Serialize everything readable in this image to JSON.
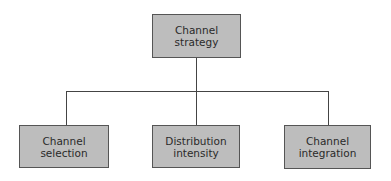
{
  "diagram": {
    "type": "hierarchy",
    "root": {
      "label": "Channel\nstrategy"
    },
    "children": [
      {
        "label": "Channel\nselection"
      },
      {
        "label": "Distribution\nintensity"
      },
      {
        "label": "Channel\nintegration"
      }
    ],
    "colors": {
      "box_fill": "#bdbdbd",
      "box_border": "#555555",
      "connector": "#444444",
      "text": "#2a2a2a",
      "background": "#ffffff"
    }
  }
}
